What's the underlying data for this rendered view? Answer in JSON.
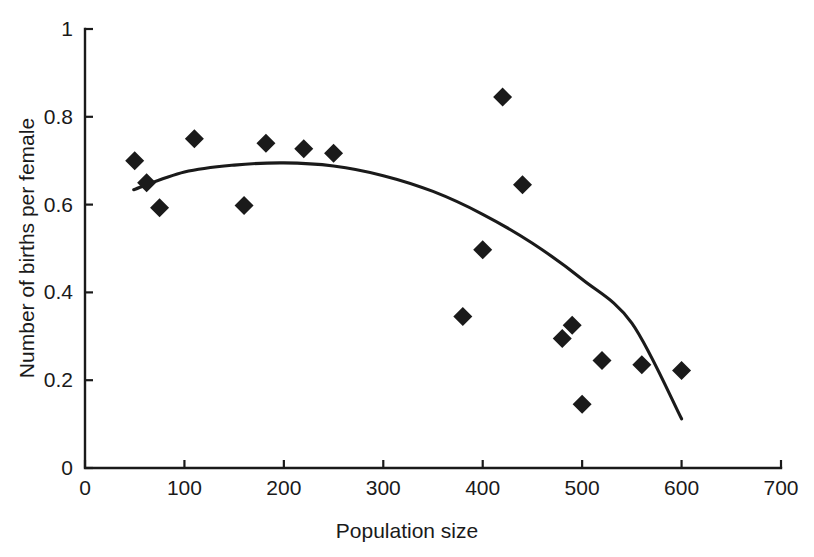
{
  "chart_data": {
    "type": "scatter",
    "title": "",
    "xlabel": "Population size",
    "ylabel": "Number of births per female",
    "xlim": [
      0,
      700
    ],
    "ylim": [
      0,
      1
    ],
    "xticks": [
      0,
      100,
      200,
      300,
      400,
      500,
      600,
      700
    ],
    "yticks": [
      0,
      0.2,
      0.4,
      0.6,
      0.8,
      1
    ],
    "xticklabels": [
      "0",
      "100",
      "200",
      "300",
      "400",
      "500",
      "600",
      "700"
    ],
    "yticklabels": [
      "0",
      "0.2",
      "0.4",
      "0.6",
      "0.8",
      "1"
    ],
    "grid": false,
    "legend": null,
    "marker_style": "filled-diamond",
    "marker_color": "#1a1a1a",
    "points": [
      {
        "x": 50,
        "y": 0.7
      },
      {
        "x": 62,
        "y": 0.65
      },
      {
        "x": 75,
        "y": 0.593
      },
      {
        "x": 110,
        "y": 0.75
      },
      {
        "x": 160,
        "y": 0.598
      },
      {
        "x": 182,
        "y": 0.74
      },
      {
        "x": 220,
        "y": 0.727
      },
      {
        "x": 250,
        "y": 0.717
      },
      {
        "x": 380,
        "y": 0.345
      },
      {
        "x": 400,
        "y": 0.497
      },
      {
        "x": 420,
        "y": 0.845
      },
      {
        "x": 440,
        "y": 0.645
      },
      {
        "x": 480,
        "y": 0.295
      },
      {
        "x": 490,
        "y": 0.325
      },
      {
        "x": 500,
        "y": 0.145
      },
      {
        "x": 520,
        "y": 0.245
      },
      {
        "x": 560,
        "y": 0.235
      },
      {
        "x": 600,
        "y": 0.222
      }
    ],
    "fit_curve": {
      "label": "quadratic fit",
      "x_start": 49,
      "x_end": 600,
      "vertex_x": 195,
      "vertex_y": 0.695,
      "samples": [
        {
          "x": 49,
          "y": 0.634
        },
        {
          "x": 100,
          "y": 0.674
        },
        {
          "x": 150,
          "y": 0.69
        },
        {
          "x": 200,
          "y": 0.695
        },
        {
          "x": 250,
          "y": 0.688
        },
        {
          "x": 300,
          "y": 0.666
        },
        {
          "x": 350,
          "y": 0.63
        },
        {
          "x": 400,
          "y": 0.578
        },
        {
          "x": 450,
          "y": 0.512
        },
        {
          "x": 500,
          "y": 0.43
        },
        {
          "x": 550,
          "y": 0.33
        },
        {
          "x": 600,
          "y": 0.112
        }
      ]
    }
  },
  "colors": {
    "ink": "#1a1a1a",
    "background": "#ffffff"
  }
}
